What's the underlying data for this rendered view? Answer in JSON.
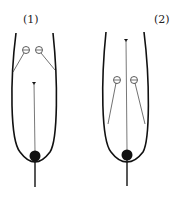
{
  "diagram": {
    "panels": [
      {
        "label": "(1)",
        "charges": [
          "⊖",
          "⊖"
        ],
        "charge_position": "upper",
        "pointer_position": "lower"
      },
      {
        "label": "(2)",
        "charges": [
          "⊖",
          "⊖"
        ],
        "charge_position": "lower",
        "pointer_position": "upper"
      }
    ],
    "colors": {
      "stroke": "#111111",
      "background": "#ffffff"
    }
  }
}
